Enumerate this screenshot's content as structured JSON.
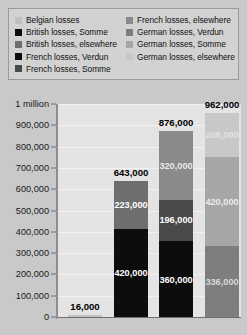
{
  "legend": {
    "columns": [
      {
        "items": [
          {
            "label": "Belgian losses",
            "color": "#c0c0c0"
          },
          {
            "label": "British losses, Somme",
            "color": "#0d0d0d"
          },
          {
            "label": "British losses, elsewhere",
            "color": "#6e6e6e"
          },
          {
            "label": "French losses, Verdun",
            "color": "#0d0d0d"
          },
          {
            "label": "French losses, Somme",
            "color": "#4a4a4a"
          }
        ]
      },
      {
        "items": [
          {
            "label": "French losses, elsewhere",
            "color": "#8a8a8a"
          },
          {
            "label": "German losses, Verdun",
            "color": "#7e7e7e"
          },
          {
            "label": "German losses, Somme",
            "color": "#a6a6a6"
          },
          {
            "label": "German losses, elsewhere",
            "color": "#c8c8c8"
          }
        ]
      }
    ]
  },
  "chart_data": {
    "type": "bar",
    "subtype": "stacked-bar",
    "title": "",
    "xlabel": "",
    "ylabel": "",
    "ylim": [
      0,
      1000000
    ],
    "grid": true,
    "legend_position": "top",
    "categories": [
      "Belgian",
      "British",
      "French",
      "German"
    ],
    "ytick_labels": [
      "0",
      "100,000",
      "200,000",
      "300,000",
      "400,000",
      "500,000",
      "600,000",
      "700,000",
      "800,000",
      "900,000",
      "1 million"
    ],
    "ytick_values": [
      0,
      100000,
      200000,
      300000,
      400000,
      500000,
      600000,
      700000,
      800000,
      900000,
      1000000
    ],
    "series": [
      {
        "name": "Belgian losses",
        "color": "#c0c0c0",
        "values": [
          16000,
          0,
          0,
          0
        ]
      },
      {
        "name": "British losses, Somme",
        "color": "#0d0d0d",
        "values": [
          0,
          420000,
          0,
          0
        ]
      },
      {
        "name": "British losses, elsewhere",
        "color": "#6e6e6e",
        "values": [
          0,
          223000,
          0,
          0
        ]
      },
      {
        "name": "French losses, Verdun",
        "color": "#0d0d0d",
        "values": [
          0,
          0,
          360000,
          0
        ]
      },
      {
        "name": "French losses, Somme",
        "color": "#4a4a4a",
        "values": [
          0,
          0,
          196000,
          0
        ]
      },
      {
        "name": "French losses, elsewhere",
        "color": "#8a8a8a",
        "values": [
          0,
          0,
          320000,
          0
        ]
      },
      {
        "name": "German losses, Verdun",
        "color": "#7e7e7e",
        "values": [
          0,
          0,
          0,
          336000
        ]
      },
      {
        "name": "German losses, Somme",
        "color": "#a6a6a6",
        "values": [
          0,
          0,
          0,
          420000
        ]
      },
      {
        "name": "German losses, elsewhere",
        "color": "#c8c8c8",
        "values": [
          0,
          0,
          0,
          206000
        ]
      }
    ],
    "totals": [
      16000,
      643000,
      876000,
      962000
    ],
    "total_labels": [
      "16,000",
      "643,000",
      "876,000",
      "962,000"
    ],
    "bars": [
      {
        "name": "Belgian",
        "total": 16000,
        "total_label": "16,000",
        "segments": [
          {
            "series": "Belgian losses",
            "value": 16000,
            "label": "",
            "color": "#c0c0c0",
            "label_color": "#ffffff"
          }
        ]
      },
      {
        "name": "British",
        "total": 643000,
        "total_label": "643,000",
        "segments": [
          {
            "series": "British losses, Somme",
            "value": 420000,
            "label": "420,000",
            "color": "#0d0d0d",
            "label_color": "#ffffff"
          },
          {
            "series": "British losses, elsewhere",
            "value": 223000,
            "label": "223,000",
            "color": "#6e6e6e",
            "label_color": "#ffffff"
          }
        ]
      },
      {
        "name": "French",
        "total": 876000,
        "total_label": "876,000",
        "segments": [
          {
            "series": "French losses, Verdun",
            "value": 360000,
            "label": "360,000",
            "color": "#0d0d0d",
            "label_color": "#ffffff"
          },
          {
            "series": "French losses, Somme",
            "value": 196000,
            "label": "196,000",
            "color": "#4a4a4a",
            "label_color": "#ffffff"
          },
          {
            "series": "French losses, elsewhere",
            "value": 320000,
            "label": "320,000",
            "color": "#8a8a8a",
            "label_color": "#e8e8e8"
          }
        ]
      },
      {
        "name": "German",
        "total": 962000,
        "total_label": "962,000",
        "segments": [
          {
            "series": "German losses, Verdun",
            "value": 336000,
            "label": "336,000",
            "color": "#7e7e7e",
            "label_color": "#d8d8d8"
          },
          {
            "series": "German losses, Somme",
            "value": 420000,
            "label": "420,000",
            "color": "#a6a6a6",
            "label_color": "#ececec"
          },
          {
            "series": "German losses, elsewhere",
            "value": 206000,
            "label": "206,000",
            "color": "#c8c8c8",
            "label_color": "#e2e2e2"
          }
        ]
      }
    ]
  },
  "colors": {
    "page_background": "#c9c9c9",
    "plot_background": "#e4e4e4",
    "legend_background": "#d2d2d2",
    "gridline": "#f2f2f2",
    "axis": "#6f6f6f"
  }
}
